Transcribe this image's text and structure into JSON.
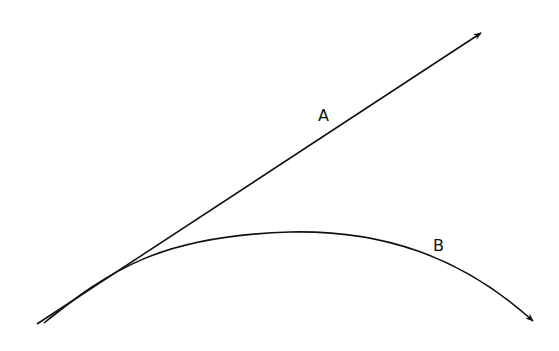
{
  "diagram": {
    "type": "trajectory-comparison",
    "colors": {
      "stroke": "#111111",
      "background": "#ffffff"
    },
    "paths": [
      {
        "id": "A",
        "label": "A",
        "shape": "straight-line-arrow"
      },
      {
        "id": "B",
        "label": "B",
        "shape": "curved-arrow"
      }
    ]
  }
}
